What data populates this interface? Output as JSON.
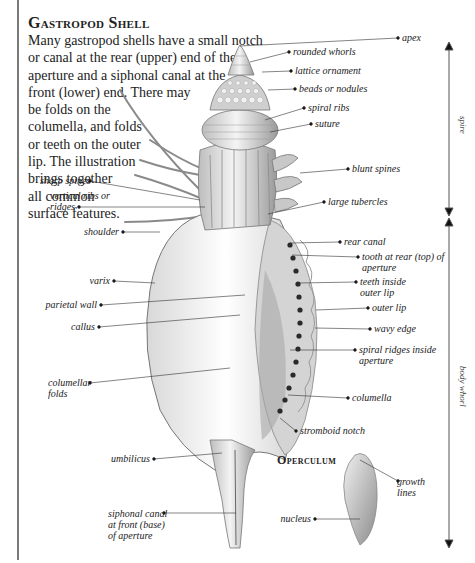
{
  "title": "Gastropod Shell",
  "intro_lines": [
    "Many gastropod shells have a small notch",
    "or canal at the rear (upper) end of the",
    "aperture and a siphonal canal at the",
    "front (lower) end. There may",
    "be folds on the",
    "columella, and folds",
    "or teeth on the outer",
    "lip. The illustration",
    "brings together",
    "all common",
    "surface features."
  ],
  "labels_right": {
    "apex": "apex",
    "rounded_whorls": "rounded whorls",
    "lattice_ornament": "lattice ornament",
    "beads_or_nodules": "beads or nodules",
    "spiral_ribs": "spiral ribs",
    "suture": "suture",
    "blunt_spines": "blunt spines",
    "large_tubercles": "large tubercles",
    "rear_canal": "rear canal",
    "tooth_at_rear_1": "tooth at rear (top) of",
    "tooth_at_rear_2": "aperture",
    "teeth_inside_1": "teeth inside",
    "teeth_inside_2": "outer lip",
    "outer_lip": "outer lip",
    "wavy_edge": "wavy edge",
    "spiral_ridges_1": "spiral ridges inside",
    "spiral_ridges_2": "aperture",
    "columella": "columella",
    "stromboid_notch": "stromboid notch"
  },
  "labels_left": {
    "sharp_spines": "sharp spines",
    "vertical_ribs_1": "vertical ribs or",
    "vertical_ribs_2": "ridges",
    "shoulder": "shoulder",
    "varix": "varix",
    "parietal_wall": "parietal wall",
    "callus": "callus",
    "columellar_folds_1": "columellar",
    "columellar_folds_2": "folds",
    "umbilicus": "umbilicus",
    "siphonal_canal_1": "siphonal canal",
    "siphonal_canal_2": "at front (base)",
    "siphonal_canal_3": "of aperture"
  },
  "operculum": {
    "title": "Operculum",
    "growth_lines_1": "growth",
    "growth_lines_2": "lines",
    "nucleus": "nucleus"
  },
  "regions": {
    "spire": "spire",
    "body_whorl": "body whorl"
  }
}
